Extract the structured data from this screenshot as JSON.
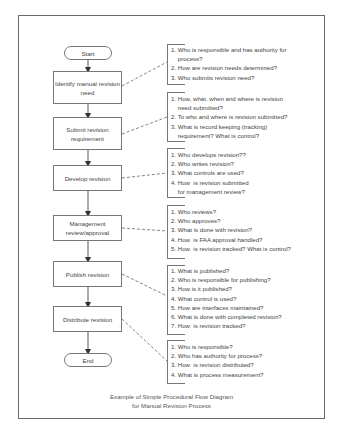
{
  "flow": {
    "start": "Start",
    "end": "End",
    "steps": [
      {
        "label": "Identify manual revision need"
      },
      {
        "label": "Submit revision requirement"
      },
      {
        "label": "Develop revision"
      },
      {
        "label": "Management review/approval"
      },
      {
        "label": "Publish revision"
      },
      {
        "label": "Distribute revision"
      }
    ]
  },
  "questions": [
    {
      "lines": "1. Who is responsible and has authority for\n    process?\n2. How are revision needs determined?\n3. Who submits revision need?"
    },
    {
      "lines": "1. How, what, when and where is revision\n    need submitted?\n2. To who and where is revision submitted?\n3. What is record keeping (tracking)\n    requirement? What is control?"
    },
    {
      "lines": "1. Who develops revision??\n2. Who writes revision?\n3. What controls are used?\n4. How  is revision submitted\n    for management review?"
    },
    {
      "lines": "1. Who reviews?\n2. Who approves?\n3. What is done with revision?\n4. How  is FAA approval handled?\n5. How  is revision tracked? What is control?"
    },
    {
      "lines": "1. What is published?\n2. Who is responsible for publishing?\n3. How is it published?\n4. What control is used?\n5. How are interfaces maintained?\n6. What is done with completed revision?\n7. How  is revision tracked?"
    },
    {
      "lines": "1. Who is responsible?\n2. Who has authority for process?\n3. How  is revision distributed?\n4. What is process measurement?"
    }
  ],
  "caption": {
    "line1": "Example of Simple Procedural Flow Diagram",
    "line2": "for Manual Revision Process"
  }
}
